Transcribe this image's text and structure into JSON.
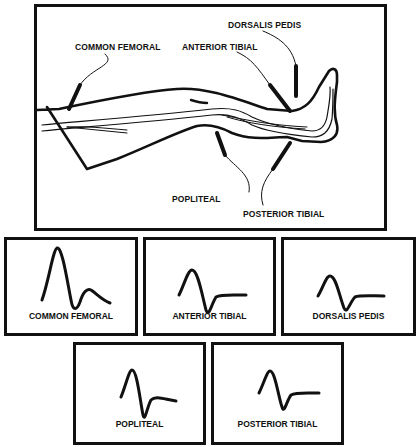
{
  "diagram": {
    "sites": [
      {
        "id": "common_femoral",
        "label": "COMMON FEMORAL"
      },
      {
        "id": "anterior_tibial",
        "label": "ANTERIOR TIBIAL"
      },
      {
        "id": "dorsalis_pedis",
        "label": "DORSALIS PEDIS"
      },
      {
        "id": "popliteal",
        "label": "POPLITEAL"
      },
      {
        "id": "posterior_tibial",
        "label": "POSTERIOR TIBIAL"
      }
    ]
  },
  "waveforms": [
    {
      "label": "COMMON FEMORAL",
      "shape": "triphasic, high peak"
    },
    {
      "label": "ANTERIOR TIBIAL",
      "shape": "triphasic"
    },
    {
      "label": "DORSALIS PEDIS",
      "shape": "triphasic"
    },
    {
      "label": "POPLITEAL",
      "shape": "triphasic"
    },
    {
      "label": "POSTERIOR TIBIAL",
      "shape": "triphasic"
    }
  ]
}
